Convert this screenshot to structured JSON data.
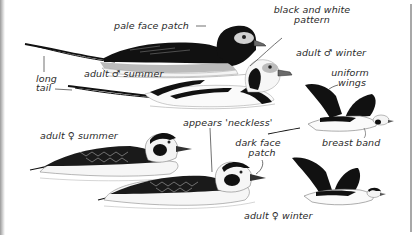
{
  "figure": {
    "labels": {
      "pale_face_patch": "pale face patch",
      "black_white_pattern_1": "black and white",
      "black_white_pattern_2": "pattern",
      "adult_male_winter": "adult ♂ winter",
      "long_tail_1": "long",
      "long_tail_2": "tail",
      "adult_male_summer": "adult ♂ summer",
      "uniform_wings_1": "uniform",
      "uniform_wings_2": "wings",
      "breast_band": "breast band",
      "adult_female_summer": "adult ♀ summer",
      "appears_neckless": "appears 'neckless'",
      "dark_face_patch_1": "dark face",
      "dark_face_patch_2": "patch",
      "adult_female_winter": "adult ♀ winter"
    },
    "colors": {
      "ink": "#111111",
      "grey_wash": "#b9b9b9",
      "pale_face": "#cfcfcf",
      "bill": "#6a6a6a",
      "label": "#2a2a2a",
      "frame": "#a8a8a8"
    }
  }
}
